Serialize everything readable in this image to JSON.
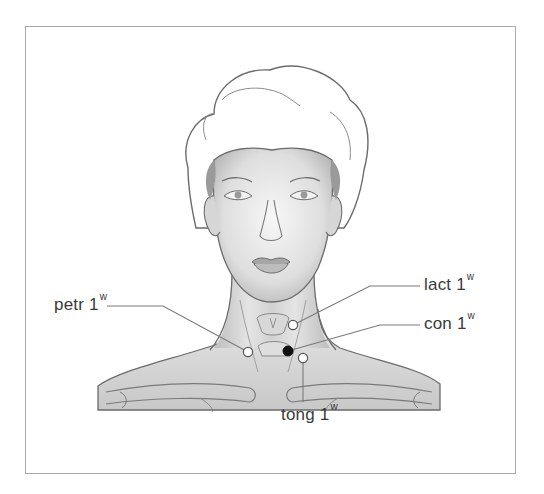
{
  "figure": {
    "labels": [
      {
        "id": "petr",
        "name": "petr 1",
        "sup": "w",
        "point": "white",
        "x": 248,
        "y": 352
      },
      {
        "id": "lact",
        "name": "lact 1",
        "sup": "w",
        "point": "white",
        "x": 293,
        "y": 325
      },
      {
        "id": "con",
        "name": "con 1",
        "sup": "w",
        "point": "black",
        "x": 288,
        "y": 351
      },
      {
        "id": "tong",
        "name": "tong 1",
        "sup": "w",
        "point": "white",
        "x": 303,
        "y": 358
      }
    ]
  },
  "colors": {
    "frame": "#a9a9a9",
    "leader": "#7a7a7a",
    "outline": "#6b6b6b",
    "shade": "#cfcfcf",
    "point_white": "#ffffff",
    "point_black": "#111111"
  }
}
